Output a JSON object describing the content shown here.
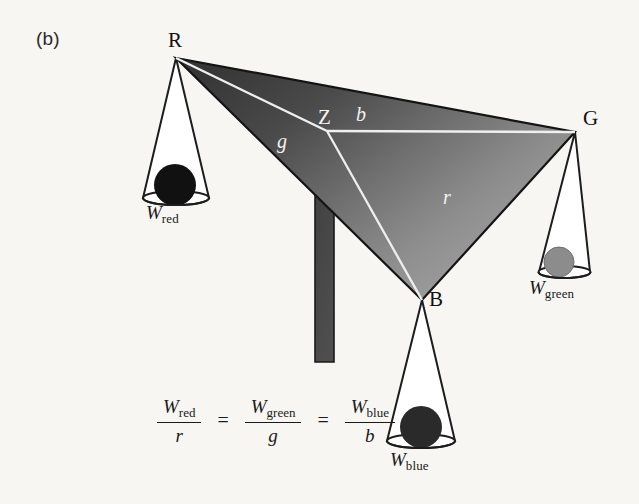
{
  "figure": {
    "panel_label": "(b)",
    "background_color": "#f7f6f3",
    "width": 639,
    "height": 504
  },
  "triangle": {
    "description": "Maxwell color triangle balance diagram with gradient fill",
    "gradient_dark": "#3a3a3a",
    "gradient_light": "#9d9d9d",
    "vertices": [
      {
        "name": "R",
        "label": "R",
        "x": 176,
        "y": 58
      },
      {
        "name": "G",
        "label": "G",
        "x": 575,
        "y": 132
      },
      {
        "name": "B",
        "label": "B",
        "x": 422,
        "y": 300
      }
    ],
    "centroid": {
      "name": "Z",
      "label": "Z",
      "x": 327,
      "y": 131
    },
    "segments": [
      {
        "name": "g",
        "label": "g",
        "from": "R",
        "to": "Z",
        "color": "#f2f2f2"
      },
      {
        "name": "b",
        "label": "b",
        "from": "G",
        "to": "Z",
        "color": "#f2f2f2"
      },
      {
        "name": "r",
        "label": "r",
        "from": "B",
        "to": "Z",
        "color": "#f2f2f2"
      }
    ]
  },
  "fulcrum": {
    "name": "support-arrow",
    "color": "#4a4a4a",
    "tip_x": 327,
    "tip_y": 132,
    "base_y": 362
  },
  "pans": [
    {
      "name": "red",
      "vertex": "R",
      "label_symbol": "W",
      "label_subscript": "red",
      "ball_color": "#111111",
      "ball_cx": 175,
      "ball_cy": 185,
      "ball_r": 21
    },
    {
      "name": "green",
      "vertex": "G",
      "label_symbol": "W",
      "label_subscript": "green",
      "ball_color": "#8c8c8c",
      "ball_cx": 559,
      "ball_cy": 262,
      "ball_r": 15
    },
    {
      "name": "blue",
      "vertex": "B",
      "label_symbol": "W",
      "label_subscript": "blue",
      "ball_color": "#2a2a2a",
      "ball_cx": 421,
      "ball_cy": 427,
      "ball_r": 21
    }
  ],
  "equation": {
    "terms": [
      {
        "numerator_symbol": "W",
        "numerator_subscript": "red",
        "denominator": "r"
      },
      {
        "numerator_symbol": "W",
        "numerator_subscript": "green",
        "denominator": "g"
      },
      {
        "numerator_symbol": "W",
        "numerator_subscript": "blue",
        "denominator": "b"
      }
    ],
    "operator": "="
  }
}
